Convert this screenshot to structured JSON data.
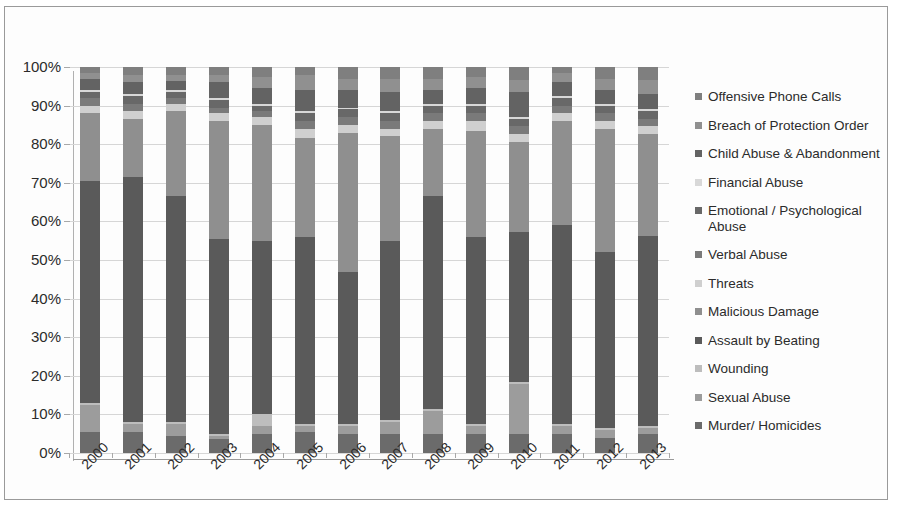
{
  "chart_data": {
    "type": "bar",
    "subtype": "100% stacked column",
    "title": "",
    "xlabel": "",
    "ylabel": "",
    "ylim": [
      0,
      100
    ],
    "ytick_labels": [
      "0%",
      "10%",
      "20%",
      "30%",
      "40%",
      "50%",
      "60%",
      "70%",
      "80%",
      "90%",
      "100%"
    ],
    "ytick_values": [
      0,
      10,
      20,
      30,
      40,
      50,
      60,
      70,
      80,
      90,
      100
    ],
    "grid": true,
    "legend_position": "right",
    "categories": [
      "2000",
      "2001",
      "2002",
      "2003",
      "2004",
      "2005",
      "2006",
      "2007",
      "2008",
      "2009",
      "2010",
      "2011",
      "2012",
      "2013"
    ],
    "series": [
      {
        "name": "Murder/ Homicides",
        "color": "#6b6b6b",
        "values": [
          5.5,
          5.5,
          4.5,
          3.5,
          5.0,
          5.5,
          5.0,
          5.0,
          5.0,
          5.0,
          5.0,
          5.0,
          4.0,
          5.0
        ]
      },
      {
        "name": "Sexual Abuse",
        "color": "#9c9c9c",
        "values": [
          7.0,
          2.0,
          3.0,
          1.0,
          2.0,
          1.5,
          2.0,
          3.0,
          6.0,
          2.0,
          13.0,
          2.0,
          2.0,
          1.5
        ]
      },
      {
        "name": "Wounding",
        "color": "#bdbdbd",
        "values": [
          0.5,
          0.5,
          0.5,
          0.5,
          3.0,
          0.5,
          0.5,
          0.5,
          0.5,
          0.5,
          0.5,
          0.5,
          0.5,
          0.5
        ]
      },
      {
        "name": "Assault by Beating",
        "color": "#5a5a5a",
        "values": [
          57.5,
          63.5,
          58.5,
          50.5,
          45.0,
          48.5,
          39.5,
          46.5,
          55.0,
          48.5,
          39.0,
          51.5,
          45.5,
          49.5
        ]
      },
      {
        "name": "Malicious Damage",
        "color": "#8f8f8f",
        "values": [
          17.5,
          15.0,
          22.0,
          30.5,
          30.0,
          25.5,
          36.0,
          27.0,
          17.5,
          27.5,
          23.5,
          27.0,
          32.0,
          26.5
        ]
      },
      {
        "name": "Threats",
        "color": "#cfcfcf",
        "values": [
          2.0,
          2.0,
          2.0,
          2.0,
          2.0,
          2.5,
          2.0,
          2.0,
          2.0,
          2.5,
          2.0,
          2.0,
          2.0,
          2.0
        ]
      },
      {
        "name": "Verbal Abuse",
        "color": "#7a7a7a",
        "values": [
          2.0,
          2.0,
          1.5,
          1.5,
          1.5,
          2.0,
          2.0,
          2.0,
          2.0,
          2.0,
          2.0,
          2.0,
          2.0,
          2.0
        ]
      },
      {
        "name": "Emotional / Psychological Abuse",
        "color": "#686868",
        "values": [
          1.5,
          2.0,
          1.5,
          2.0,
          1.5,
          2.0,
          2.0,
          2.0,
          2.0,
          2.0,
          2.0,
          2.0,
          2.0,
          2.0
        ]
      },
      {
        "name": "Financial Abuse",
        "color": "#d8d8d8",
        "values": [
          0.5,
          0.5,
          0.5,
          0.5,
          0.5,
          0.5,
          0.5,
          0.5,
          0.5,
          0.5,
          0.5,
          0.5,
          0.5,
          0.5
        ]
      },
      {
        "name": "Child Abuse & Abandonment",
        "color": "#636363",
        "values": [
          3.0,
          3.0,
          2.5,
          4.0,
          4.0,
          5.5,
          4.5,
          5.0,
          3.5,
          4.0,
          6.5,
          3.5,
          3.5,
          4.0
        ]
      },
      {
        "name": "Breach of Protection Order",
        "color": "#909090",
        "values": [
          1.5,
          2.0,
          1.5,
          2.0,
          3.0,
          4.0,
          3.0,
          3.5,
          3.0,
          3.0,
          3.0,
          2.5,
          3.0,
          3.5
        ]
      },
      {
        "name": "Offensive Phone Calls",
        "color": "#7f7f7f",
        "values": [
          1.5,
          2.0,
          2.0,
          2.0,
          2.5,
          2.0,
          3.0,
          3.0,
          3.0,
          2.5,
          3.5,
          1.5,
          3.0,
          3.5
        ]
      }
    ]
  },
  "legend": {
    "items": [
      {
        "label": "Offensive Phone Calls",
        "color": "#7f7f7f"
      },
      {
        "label": "Breach of Protection Order",
        "color": "#909090"
      },
      {
        "label": "Child Abuse & Abandonment",
        "color": "#636363"
      },
      {
        "label": "Financial Abuse",
        "color": "#d8d8d8"
      },
      {
        "label": "Emotional / Psychological Abuse",
        "color": "#686868"
      },
      {
        "label": "Verbal Abuse",
        "color": "#7a7a7a"
      },
      {
        "label": "Threats",
        "color": "#cfcfcf"
      },
      {
        "label": "Malicious Damage",
        "color": "#8f8f8f"
      },
      {
        "label": "Assault by Beating",
        "color": "#5a5a5a"
      },
      {
        "label": "Wounding",
        "color": "#bdbdbd"
      },
      {
        "label": "Sexual Abuse",
        "color": "#9c9c9c"
      },
      {
        "label": "Murder/ Homicides",
        "color": "#6b6b6b"
      }
    ]
  }
}
